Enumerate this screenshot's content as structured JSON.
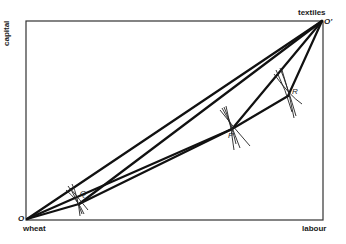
{
  "diagram": {
    "type": "edgeworth-box",
    "axes": {
      "left_label": "capital",
      "bottom_right_label": "labour",
      "top_right_label": "textiles",
      "bottom_left_label": "wheat"
    },
    "origins": {
      "bottom_left": "O",
      "top_right": "O'"
    },
    "points": [
      {
        "id": "Q",
        "label": "Q",
        "x": 79,
        "y": 204
      },
      {
        "id": "P",
        "label": "P",
        "x": 232,
        "y": 129
      },
      {
        "id": "R",
        "label": "R",
        "x": 288,
        "y": 96
      }
    ],
    "colors": {
      "line": "#111111",
      "box": "#333333",
      "background": "#ffffff"
    }
  }
}
